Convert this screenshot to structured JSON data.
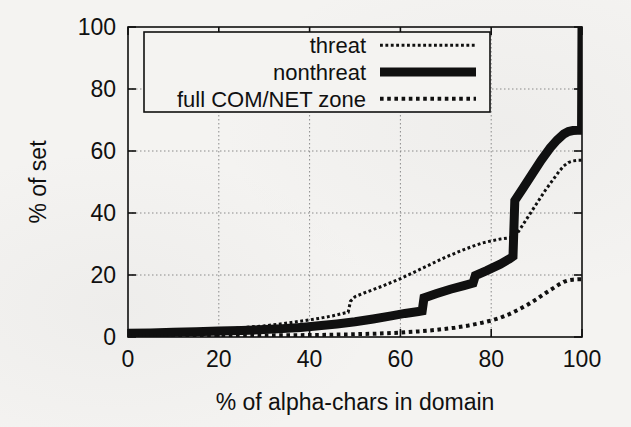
{
  "figure": {
    "background_color": "#f4f3f1",
    "ink_color": "#101010",
    "grid_color": "#8a8a8a"
  },
  "axes": {
    "x_title": "% of alpha-chars in domain",
    "y_title": "% of set",
    "x_ticks": [
      "0",
      "20",
      "40",
      "60",
      "80",
      "100"
    ],
    "y_ticks": [
      "0",
      "20",
      "40",
      "60",
      "80",
      "100"
    ]
  },
  "legend": {
    "entries": [
      {
        "label": "threat",
        "style": "dotted",
        "color": "#101010"
      },
      {
        "label": "nonthreat",
        "style": "thick-solid",
        "color": "#101010"
      },
      {
        "label": "full COM/NET zone",
        "style": "fine-dotted",
        "color": "#101010"
      }
    ]
  },
  "chart_data": {
    "type": "line",
    "title": "",
    "subtitle": "",
    "xlabel": "% of alpha-chars in domain",
    "ylabel": "% of set",
    "xlim": [
      0,
      100
    ],
    "ylim": [
      0,
      100
    ],
    "xticks": [
      0,
      20,
      40,
      60,
      80,
      100
    ],
    "yticks": [
      0,
      20,
      40,
      60,
      80,
      100
    ],
    "grid": true,
    "grid_style": "dotted",
    "legend_position": "top-center",
    "annotations": [
      "nonthreat jumps vertically from ~26% to ~44% at x=85",
      "nonthreat jumps vertically from ~66% to 100% at x=100",
      "threat steps up from ~8% to ~13% near x=49"
    ],
    "series": [
      {
        "name": "threat",
        "style": "dotted",
        "linewidth": 3,
        "x": [
          0,
          5,
          10,
          15,
          20,
          25,
          30,
          33,
          36,
          39,
          42,
          45,
          47,
          48.5,
          49,
          50,
          52,
          54,
          56,
          58,
          60,
          62,
          64,
          66,
          68,
          70,
          72,
          74,
          76,
          78,
          80,
          82,
          84,
          85,
          86,
          88,
          90,
          92,
          94,
          95,
          96,
          97,
          98,
          99,
          100
        ],
        "y": [
          1.0,
          1.3,
          1.6,
          2.0,
          2.4,
          3.0,
          3.6,
          4.1,
          4.7,
          5.3,
          6.0,
          6.8,
          7.5,
          8.0,
          11.5,
          13.0,
          14.2,
          15.3,
          16.4,
          17.6,
          18.8,
          20.2,
          21.6,
          23.0,
          24.4,
          25.8,
          27.0,
          28.2,
          29.3,
          30.3,
          31.0,
          31.6,
          32.0,
          32.2,
          34.0,
          38.5,
          43.0,
          47.5,
          51.5,
          53.5,
          55.2,
          56.3,
          56.8,
          57.0,
          57.0
        ]
      },
      {
        "name": "nonthreat",
        "style": "thick-solid",
        "linewidth": 9,
        "x": [
          0,
          5,
          10,
          15,
          20,
          25,
          30,
          34,
          38,
          42,
          46,
          50,
          54,
          58,
          61,
          64,
          64.8,
          65.2,
          68,
          71,
          74,
          76,
          76.5,
          79,
          82,
          84,
          84.8,
          85.2,
          87,
          89,
          91,
          93,
          94.5,
          96,
          97,
          98,
          99,
          99.6,
          99.9,
          100
        ],
        "y": [
          1.2,
          1.3,
          1.5,
          1.7,
          1.9,
          2.1,
          2.4,
          2.7,
          3.1,
          3.6,
          4.2,
          4.9,
          5.8,
          6.8,
          7.6,
          8.2,
          8.4,
          12.6,
          14.0,
          15.4,
          16.6,
          17.4,
          19.8,
          21.4,
          23.5,
          25.2,
          26.0,
          44.0,
          48.0,
          52.5,
          57.0,
          61.0,
          63.5,
          65.5,
          66.3,
          66.6,
          66.7,
          66.7,
          66.7,
          100.0
        ]
      },
      {
        "name": "full COM/NET zone",
        "style": "fine-dotted",
        "linewidth": 4,
        "x": [
          0,
          10,
          20,
          30,
          38,
          44,
          50,
          55,
          60,
          64,
          68,
          72,
          75,
          78,
          80,
          82,
          84,
          86,
          88,
          90,
          92,
          93.5,
          95,
          96,
          97,
          98,
          99,
          100
        ],
        "y": [
          0.3,
          0.35,
          0.4,
          0.5,
          0.6,
          0.7,
          0.9,
          1.1,
          1.4,
          1.8,
          2.3,
          3.0,
          3.7,
          4.6,
          5.3,
          6.2,
          7.4,
          8.8,
          10.4,
          12.2,
          14.2,
          15.6,
          17.0,
          17.8,
          18.3,
          18.5,
          18.6,
          18.6
        ]
      }
    ]
  },
  "plot_geometry": {
    "left": 128,
    "right": 582,
    "top": 27,
    "bottom": 337
  },
  "legend_geometry": {
    "left": 144,
    "right": 490,
    "top": 32,
    "bottom": 112
  }
}
